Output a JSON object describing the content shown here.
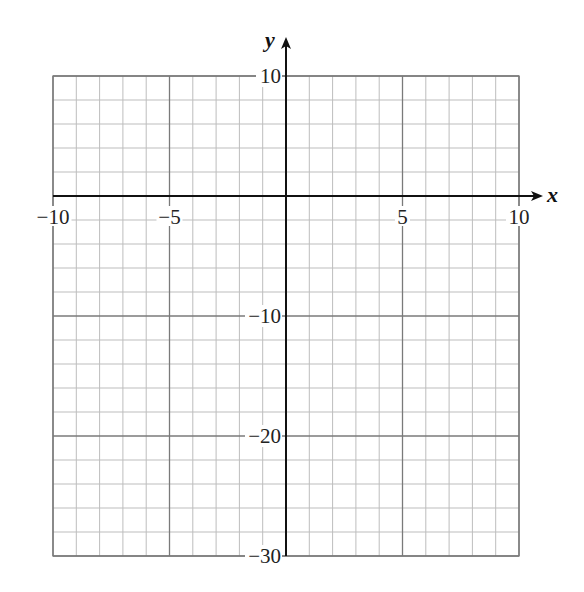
{
  "chart_data": {
    "type": "line",
    "title": "",
    "xlabel": "x",
    "ylabel": "y",
    "xlim": [
      -10,
      10
    ],
    "ylim": [
      -30,
      10
    ],
    "grid": true,
    "x_minor_step": 1,
    "y_minor_step": 2,
    "x_major_step": 5,
    "y_major_step": 10,
    "x_tick_labels": [
      "−10",
      "−5",
      "5",
      "10"
    ],
    "x_tick_values": [
      -10,
      -5,
      5,
      10
    ],
    "y_tick_labels": [
      "10",
      "−10",
      "−20",
      "−30"
    ],
    "y_tick_values": [
      10,
      -10,
      -20,
      -30
    ],
    "series": []
  },
  "colors": {
    "axis": "#111111",
    "major_grid": "#7a7a7a",
    "minor_grid": "#bdbdbd",
    "background": "#ffffff"
  },
  "layout": {
    "plot_left": 53,
    "plot_right": 519,
    "plot_top": 76,
    "plot_bottom": 556,
    "x_arrow_end": 543,
    "y_arrow_end": 37
  }
}
